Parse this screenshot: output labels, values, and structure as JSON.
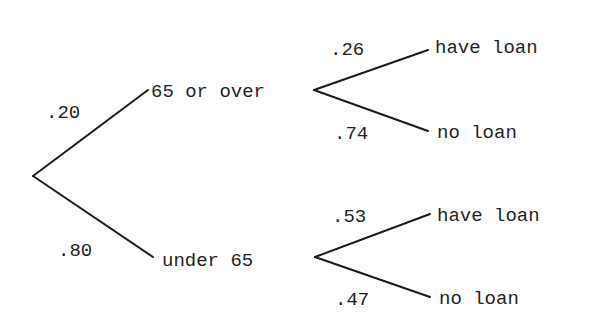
{
  "tree": {
    "root": {
      "branches": [
        {
          "probability": ".20",
          "label": "65 or over",
          "branches": [
            {
              "probability": ".26",
              "label": "have loan"
            },
            {
              "probability": ".74",
              "label": "no loan"
            }
          ]
        },
        {
          "probability": ".80",
          "label": "under 65",
          "branches": [
            {
              "probability": ".53",
              "label": "have loan"
            },
            {
              "probability": ".47",
              "label": "no loan"
            }
          ]
        }
      ]
    }
  },
  "colors": {
    "ink": "#1a1a1a",
    "background": "#ffffff"
  }
}
